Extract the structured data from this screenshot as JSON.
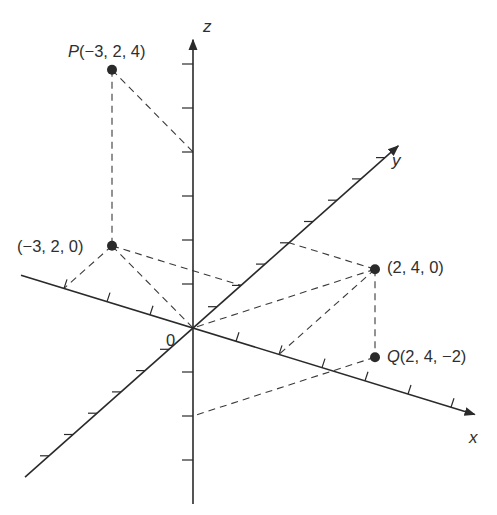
{
  "diagram": {
    "axes": {
      "x": {
        "label": "x",
        "min": -4,
        "max": 6
      },
      "y": {
        "label": "y",
        "min": -7,
        "max": 8
      },
      "z": {
        "label": "z",
        "min": -4,
        "max": 6
      },
      "origin_label": "0"
    },
    "points": [
      {
        "id": "P",
        "name_label": "P",
        "coords_label": "(−3, 2, 4)",
        "coords": [
          -3,
          2,
          4
        ]
      },
      {
        "id": "P0",
        "name_label": "",
        "coords_label": "(−3, 2, 0)",
        "coords": [
          -3,
          2,
          0
        ]
      },
      {
        "id": "R",
        "name_label": "",
        "coords_label": "(2, 4, 0)",
        "coords": [
          2,
          4,
          0
        ]
      },
      {
        "id": "Q",
        "name_label": "Q",
        "coords_label": "(2, 4, −2)",
        "coords": [
          2,
          4,
          -2
        ]
      }
    ],
    "dashed_segments": [
      {
        "from": [
          -3,
          2,
          4
        ],
        "to": [
          -3,
          2,
          0
        ]
      },
      {
        "from": [
          -3,
          2,
          4
        ],
        "to": [
          0,
          0,
          4
        ]
      },
      {
        "from": [
          -3,
          2,
          0
        ],
        "to": [
          -3,
          0,
          0
        ]
      },
      {
        "from": [
          -3,
          2,
          0
        ],
        "to": [
          0,
          2,
          0
        ]
      },
      {
        "from": [
          -3,
          2,
          0
        ],
        "to": [
          0,
          0,
          0
        ]
      },
      {
        "from": [
          2,
          4,
          0
        ],
        "to": [
          0,
          4,
          0
        ]
      },
      {
        "from": [
          2,
          4,
          0
        ],
        "to": [
          2,
          0,
          0
        ]
      },
      {
        "from": [
          2,
          4,
          0
        ],
        "to": [
          0,
          0,
          0
        ]
      },
      {
        "from": [
          2,
          4,
          0
        ],
        "to": [
          2,
          4,
          -2
        ]
      },
      {
        "from": [
          2,
          4,
          -2
        ],
        "to": [
          0,
          0,
          -2
        ]
      }
    ]
  }
}
